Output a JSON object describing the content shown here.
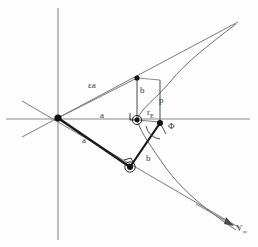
{
  "figure": {
    "background_color": "#fdfdfd",
    "width": 258,
    "height": 247
  },
  "labels": {
    "eccentricity_times_a": "εa",
    "semi_major_axis_on_axis": "a",
    "semi_major_axis_on_radius": "a",
    "semi_minor_axis_upper": "b",
    "semi_minor_axis_lower": "b",
    "semi_latus_rectum": "p",
    "radius_periapsis_symbol": "r",
    "radius_periapsis_subscript": "E",
    "deflection_angle": "Φ",
    "velocity_symbol": "V",
    "velocity_subscript": "∞"
  },
  "colors": {
    "axis": "#8a8a8a",
    "asymptote": "#7b7b7b",
    "curve": "#6e6e6e",
    "radius": "#1a1a1a",
    "label_text": "#3b3b3b",
    "node": "#111111"
  },
  "geometry": {
    "center_point": {
      "x": 58,
      "y": 118
    },
    "focus_point": {
      "x": 160,
      "y": 123
    },
    "periapsis_point": {
      "x": 137,
      "y": 120
    },
    "upper_b_point": {
      "x": 137,
      "y": 78
    },
    "lower_node_point": {
      "x": 130,
      "y": 167
    },
    "vertical_axis": {
      "x": 58,
      "y_top": 8,
      "y_bottom": 240
    },
    "horizontal_axis": {
      "y": 119,
      "x_left": 6,
      "x_right": 250
    },
    "asymptote_upper_slope_deg": -28,
    "asymptote_lower_slope_deg": 28
  },
  "elements": {
    "names": [
      "vertical-axis",
      "horizontal-axis",
      "upper-asymptote",
      "lower-asymptote",
      "hyperbola-upper-branch",
      "hyperbola-lower-branch",
      "radius-to-upper-b",
      "radius-to-lower-node",
      "semi-latus-rectum-segment",
      "periapsis-radius-segment",
      "deflection-angle-arc",
      "velocity-arrow"
    ]
  }
}
